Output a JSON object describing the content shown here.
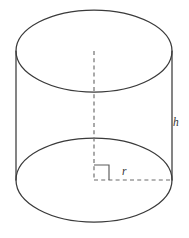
{
  "figure": {
    "name": "cylinder-diagram",
    "background_color": "#ffffff",
    "stroke_color": "#3a3a3a",
    "dashed_color": "#6b6b6b",
    "label_color": "#333333"
  },
  "labels": {
    "height": "h",
    "radius": "r"
  },
  "geometry": {
    "canvas": {
      "width": 189,
      "height": 238
    },
    "top_ellipse": {
      "cx": 94,
      "cy": 51,
      "rx": 78,
      "ry": 41
    },
    "bottom_ellipse": {
      "cx": 94,
      "cy": 180,
      "rx": 78,
      "ry": 42
    },
    "left_side": {
      "x": 16,
      "y1": 51,
      "y2": 180
    },
    "right_side": {
      "x": 172,
      "y1": 51,
      "y2": 180
    },
    "axis_dashed": {
      "x": 94,
      "y1": 51,
      "y2": 180
    },
    "radius_dashed": {
      "y": 180,
      "x1": 94,
      "x2": 172
    },
    "right_angle_marker": {
      "x": 94,
      "y": 180,
      "size": 15
    },
    "height_label_pos": {
      "x": 173,
      "y": 126
    },
    "radius_label_pos": {
      "x": 122,
      "y": 175
    }
  }
}
